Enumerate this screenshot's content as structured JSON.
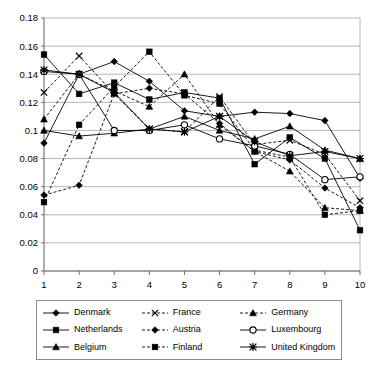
{
  "chart_data": {
    "type": "line",
    "title": "",
    "xlabel": "",
    "ylabel": "",
    "xlim": [
      1,
      10
    ],
    "ylim": [
      0,
      0.18
    ],
    "grid": true,
    "legend_position": "bottom",
    "x": [
      1,
      2,
      3,
      4,
      5,
      6,
      7,
      8,
      9,
      10
    ],
    "xtick_labels": [
      "1",
      "2",
      "3",
      "4",
      "5",
      "6",
      "7",
      "8",
      "9",
      "10"
    ],
    "ytick_labels": [
      "0",
      "0.02",
      "0.04",
      "0.06",
      "0.08",
      "0.1",
      "0.12",
      "0.14",
      "0.16",
      "0.18"
    ],
    "ytick_values": [
      0,
      0.02,
      0.04,
      0.06,
      0.08,
      0.1,
      0.12,
      0.14,
      0.16,
      0.18
    ],
    "series": [
      {
        "name": "Denmark",
        "marker": "diamond",
        "line": "solid",
        "fill": "filled",
        "values": [
          0.091,
          0.14,
          0.149,
          0.135,
          0.114,
          0.11,
          0.113,
          0.112,
          0.107,
          0.066
        ]
      },
      {
        "name": "Netherlands",
        "marker": "square",
        "line": "solid",
        "fill": "filled",
        "values": [
          0.154,
          0.126,
          0.134,
          0.122,
          0.127,
          0.123,
          0.076,
          0.095,
          0.08,
          0.029
        ]
      },
      {
        "name": "Belgium",
        "marker": "triangle",
        "line": "solid",
        "fill": "filled",
        "values": [
          0.1,
          0.096,
          0.098,
          0.101,
          0.11,
          0.1,
          0.094,
          0.103,
          0.086,
          0.08
        ]
      },
      {
        "name": "France",
        "marker": "x",
        "line": "dashed",
        "fill": "stroke",
        "values": [
          0.127,
          0.153,
          0.126,
          0.101,
          0.099,
          0.124,
          0.09,
          0.093,
          0.083,
          0.05
        ]
      },
      {
        "name": "Austria",
        "marker": "diamond",
        "line": "dashed",
        "fill": "filled",
        "values": [
          0.054,
          0.061,
          0.126,
          0.13,
          0.126,
          0.105,
          0.085,
          0.079,
          0.059,
          0.045
        ]
      },
      {
        "name": "Finland",
        "marker": "square",
        "line": "dashed",
        "fill": "filled",
        "values": [
          0.049,
          0.104,
          0.131,
          0.156,
          0.125,
          0.119,
          0.086,
          0.081,
          0.04,
          0.043
        ]
      },
      {
        "name": "Germany",
        "marker": "triangle",
        "line": "dashed",
        "fill": "filled",
        "values": [
          0.108,
          0.14,
          0.128,
          0.117,
          0.14,
          0.104,
          0.085,
          0.071,
          0.045,
          0.043
        ]
      },
      {
        "name": "Luxembourg",
        "marker": "circle",
        "line": "solid",
        "fill": "open",
        "values": [
          0.142,
          0.14,
          0.1,
          0.1,
          0.104,
          0.094,
          0.089,
          0.083,
          0.065,
          0.067
        ]
      },
      {
        "name": "United Kingdom",
        "marker": "asterisk",
        "line": "solid",
        "fill": "stroke",
        "values": [
          0.143,
          0.14,
          0.127,
          0.101,
          0.099,
          0.11,
          0.092,
          0.082,
          0.085,
          0.08
        ]
      }
    ]
  },
  "legend": {
    "entries": [
      {
        "label": "Denmark"
      },
      {
        "label": "France"
      },
      {
        "label": "Germany"
      },
      {
        "label": "Netherlands"
      },
      {
        "label": "Austria"
      },
      {
        "label": "Luxembourg"
      },
      {
        "label": "Belgium"
      },
      {
        "label": "Finland"
      },
      {
        "label": "United Kingdom"
      }
    ]
  },
  "colors": {
    "series_stroke": "#000000",
    "gridline": "#9a9a9a",
    "axis": "#6f6f6f",
    "background": "#ffffff"
  }
}
